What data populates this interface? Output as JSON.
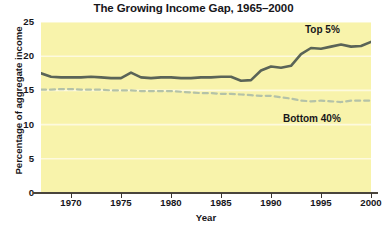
{
  "chart_data": {
    "type": "line",
    "title": "The Growing Income Gap, 1965–2000",
    "xlabel": "Year",
    "ylabel": "Percentage of aggregate income",
    "xlim": [
      1967,
      2000
    ],
    "ylim": [
      0,
      25
    ],
    "yticks": [
      0,
      5,
      10,
      15,
      20,
      25
    ],
    "xticks": [
      1970,
      1975,
      1980,
      1985,
      1990,
      1995,
      2000
    ],
    "grid": true,
    "legend_position": "inline-annotation",
    "plot_background": "#f8f3ab",
    "x": [
      1967,
      1968,
      1969,
      1970,
      1971,
      1972,
      1973,
      1974,
      1975,
      1976,
      1977,
      1978,
      1979,
      1980,
      1981,
      1982,
      1983,
      1984,
      1985,
      1986,
      1987,
      1988,
      1989,
      1990,
      1991,
      1992,
      1993,
      1994,
      1995,
      1996,
      1997,
      1998,
      1999,
      2000
    ],
    "series": [
      {
        "name": "Top 5%",
        "color": "#5a6457",
        "style": "solid",
        "values": [
          17.5,
          17.0,
          16.9,
          16.9,
          16.9,
          17.0,
          16.9,
          16.8,
          16.8,
          17.6,
          16.9,
          16.8,
          16.9,
          16.9,
          16.8,
          16.8,
          16.9,
          16.9,
          17.0,
          17.0,
          16.4,
          16.5,
          17.9,
          18.5,
          18.3,
          18.6,
          20.3,
          21.2,
          21.1,
          21.4,
          21.7,
          21.4,
          21.5,
          22.1
        ]
      },
      {
        "name": "Bottom 40%",
        "color": "#b4c2a8",
        "style": "dashed",
        "values": [
          15.1,
          15.1,
          15.2,
          15.2,
          15.1,
          15.1,
          15.1,
          15.0,
          15.0,
          15.0,
          14.9,
          14.9,
          14.9,
          14.9,
          14.8,
          14.7,
          14.6,
          14.6,
          14.5,
          14.5,
          14.4,
          14.3,
          14.2,
          14.2,
          14.0,
          13.8,
          13.5,
          13.4,
          13.5,
          13.4,
          13.3,
          13.5,
          13.5,
          13.5
        ]
      }
    ],
    "annotations": [
      {
        "text": "Top 5%",
        "near_x": 1999,
        "near_y": 23.5
      },
      {
        "text": "Bottom 40%",
        "near_x": 1997,
        "near_y": 11.5
      }
    ]
  },
  "ytick_labels": [
    "25",
    "20",
    "15",
    "10",
    "5",
    "0"
  ],
  "xtick_labels": [
    "1970",
    "1975",
    "1980",
    "1985",
    "1990",
    "1995",
    "2000"
  ],
  "labels": {
    "top5": "Top 5%",
    "bottom40": "Bottom 40%"
  }
}
